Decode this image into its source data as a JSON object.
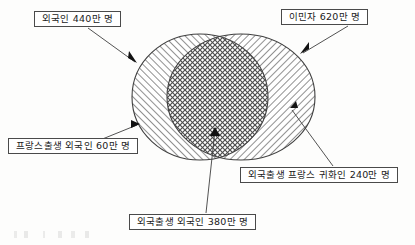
{
  "document": {
    "type": "venn-diagram",
    "title_visible": false
  },
  "diagram": {
    "sets": [
      {
        "id": "foreigners",
        "label": "외국인 440만 명",
        "value": 440,
        "unit": "만 명",
        "fill": "diagonal-hatch-up",
        "shape": "ellipse",
        "position": "left"
      },
      {
        "id": "immigrants",
        "label": "이민자 620만 명",
        "value": 620,
        "unit": "만 명",
        "fill": "diagonal-hatch-down",
        "shape": "ellipse",
        "position": "right"
      }
    ],
    "regions": [
      {
        "id": "french-born-foreigners",
        "label": "프랑스출생 외국인 60만 명",
        "value": 60,
        "unit": "만 명",
        "belongs_to": "foreigners-only"
      },
      {
        "id": "foreign-born-foreigners",
        "label": "외국출생 외국인 380만 명",
        "value": 380,
        "unit": "만 명",
        "belongs_to": "intersection"
      },
      {
        "id": "foreign-born-naturalized",
        "label": "외국출생 프랑스 귀화인 240만 명",
        "value": 240,
        "unit": "만 명",
        "belongs_to": "immigrants-only"
      }
    ]
  },
  "callouts": {
    "foreigners": "외국인 440만 명",
    "immigrants": "이민자 620만 명",
    "french_born_foreigners": "프랑스출생  외국인 60만 명",
    "foreign_born_naturalized": "외국출생 프랑스 귀화인 240만 명",
    "foreign_born_foreigners": "외국출생 외국인 380만 명"
  },
  "colors": {
    "line": "#4a4a4a",
    "hatch": "#555555",
    "background": "#fdfdfc",
    "text": "#1a1a1a"
  }
}
